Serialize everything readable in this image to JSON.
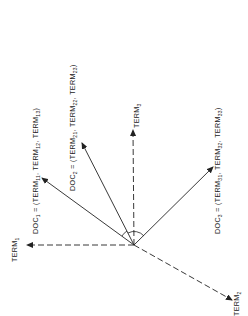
{
  "diagram": {
    "type": "vector-space-model",
    "orientation": "rotated 90deg counter-clockwise",
    "colors": {
      "ink": "#222222",
      "background": "#ffffff"
    },
    "axes": [
      {
        "id": "term1",
        "label": "TERM",
        "subscript": "1",
        "style": "dashed"
      },
      {
        "id": "term2",
        "label": "TERM",
        "subscript": "2",
        "style": "dashed"
      },
      {
        "id": "term3",
        "label": "TERM",
        "subscript": "3",
        "style": "dashed"
      }
    ],
    "documents": [
      {
        "id": "doc1",
        "prefix": "DOC",
        "prefix_sub": "1",
        "equals": " = (",
        "terms": [
          {
            "t": "TERM",
            "s": "11"
          },
          {
            "t": "TERM",
            "s": "12"
          },
          {
            "t": "TERM",
            "s": "13"
          }
        ],
        "close": ")"
      },
      {
        "id": "doc2",
        "prefix": "DOC",
        "prefix_sub": "2",
        "equals": " = (",
        "terms": [
          {
            "t": "TERM",
            "s": "21"
          },
          {
            "t": "TERM",
            "s": "22"
          },
          {
            "t": "TERM",
            "s": "23"
          }
        ],
        "close": ")"
      },
      {
        "id": "doc3",
        "prefix": "DOC",
        "prefix_sub": "3",
        "equals": " = (",
        "terms": [
          {
            "t": "TERM",
            "s": "31"
          },
          {
            "t": "TERM",
            "s": "32"
          },
          {
            "t": "TERM",
            "s": "33"
          }
        ],
        "close": ")"
      }
    ],
    "sep": ", ",
    "angle_marks": [
      "doc1-doc2 angle",
      "doc2-doc3 angle"
    ]
  }
}
